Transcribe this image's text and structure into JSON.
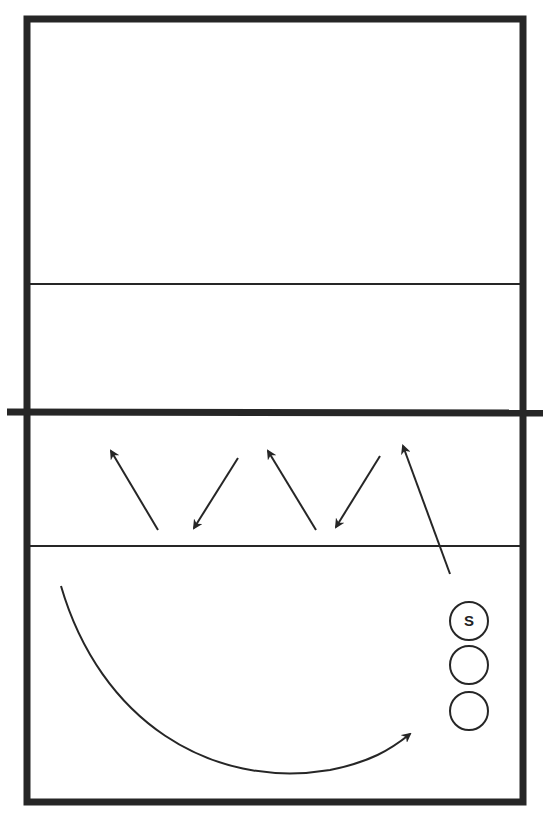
{
  "diagram": {
    "type": "volleyball-court-drill",
    "colors": {
      "line": "#262626",
      "background": "#ffffff"
    },
    "court": {
      "left": 27,
      "top": 19,
      "right": 523,
      "bottom": 802
    },
    "net": {
      "y": 412,
      "x1": 7,
      "x2": 543
    },
    "attack_lines": [
      {
        "y": 284
      },
      {
        "y": 546
      }
    ],
    "zigzag_arrows": [
      {
        "from": [
          158,
          530
        ],
        "to": [
          111,
          451
        ]
      },
      {
        "from": [
          238,
          458
        ],
        "to": [
          194,
          528
        ]
      },
      {
        "from": [
          316,
          530
        ],
        "to": [
          268,
          451
        ]
      },
      {
        "from": [
          380,
          456
        ],
        "to": [
          336,
          527
        ]
      },
      {
        "from": [
          450,
          574
        ],
        "to": [
          403,
          446
        ]
      }
    ],
    "curve_arrow": {
      "path": "M61,586 C100,720 210,790 330,770 C370,762 390,750 410,734"
    },
    "players": [
      {
        "cx": 469,
        "cy": 621,
        "r": 19,
        "label": "S"
      },
      {
        "cx": 469,
        "cy": 665,
        "r": 19,
        "label": ""
      },
      {
        "cx": 469,
        "cy": 711,
        "r": 19,
        "label": ""
      }
    ]
  }
}
